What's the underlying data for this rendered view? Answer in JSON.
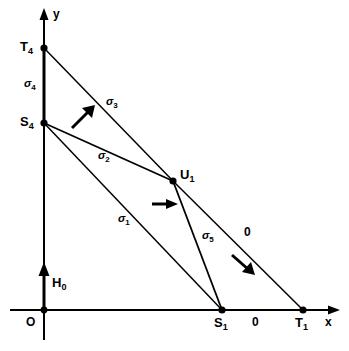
{
  "figure": {
    "background_color": "#ffffff",
    "stroke_color": "#000000",
    "width": 349,
    "height": 351
  },
  "axes": {
    "x_label": "x",
    "y_label": "y",
    "origin_label": "O",
    "x_axis_name": "x-axis",
    "y_axis_name": "y-axis"
  },
  "vectors": {
    "h0_label": "H",
    "h0_sub": "0"
  },
  "points": [
    {
      "id": "T4",
      "base": "T",
      "sub": "4",
      "x": 44,
      "y": 48,
      "label_x": 22,
      "label_y": 41
    },
    {
      "id": "S4",
      "base": "S",
      "sub": "4",
      "x": 44,
      "y": 123,
      "label_x": 22,
      "label_y": 116
    },
    {
      "id": "U1",
      "base": "U",
      "sub": "1",
      "x": 173,
      "y": 181,
      "label_x": 180,
      "label_y": 170
    },
    {
      "id": "S1",
      "base": "S",
      "sub": "1",
      "x": 222,
      "y": 310,
      "label_x": 215,
      "label_y": 316
    },
    {
      "id": "T1",
      "base": "T",
      "sub": "1",
      "x": 303,
      "y": 310,
      "label_x": 296,
      "label_y": 316
    }
  ],
  "segments": [
    {
      "id": "sigma4",
      "base": "σ",
      "sub": "4",
      "from": "T4",
      "to": "S4",
      "label_x": 24,
      "label_y": 80
    },
    {
      "id": "sigma3",
      "base": "σ",
      "sub": "3",
      "from": "T4",
      "to": "U1",
      "label_x": 106,
      "label_y": 98
    },
    {
      "id": "sigma2",
      "base": "σ",
      "sub": "2",
      "from": "S4",
      "to": "U1",
      "label_x": 98,
      "label_y": 152
    },
    {
      "id": "sigma1",
      "base": "σ",
      "sub": "1",
      "from": "S4",
      "to": "S1",
      "label_x": 118,
      "label_y": 215
    },
    {
      "id": "sigma5",
      "base": "σ",
      "sub": "5",
      "from": "U1",
      "to": "S1",
      "label_x": 202,
      "label_y": 232
    }
  ],
  "zero_labels": [
    {
      "id": "zero-upper",
      "text": "0",
      "x": 246,
      "y": 229
    },
    {
      "id": "zero-axis",
      "text": "0",
      "x": 254,
      "y": 315
    }
  ],
  "arrows": [
    {
      "id": "arrow-upper-right",
      "direction": "up-right",
      "x": 82,
      "y": 118
    },
    {
      "id": "arrow-middle",
      "direction": "right",
      "x": 165,
      "y": 204
    },
    {
      "id": "arrow-lower-right",
      "direction": "down-right",
      "x": 242,
      "y": 265
    }
  ]
}
